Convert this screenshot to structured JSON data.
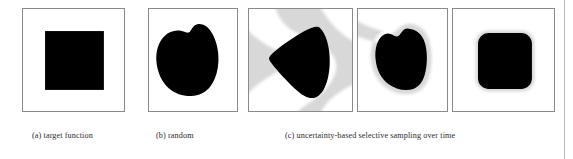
{
  "figure": {
    "kind": "figure-illustration",
    "background_color": "#ffffff",
    "panel_border_color": "#8a8a8a",
    "shape_fill_color": "#000000",
    "uncertainty_region_color": "#d8d8d8",
    "page_edge_rule_color": "#b9b9b9",
    "panels": [
      {
        "id": "panel-a",
        "group": "a",
        "shape": "square",
        "has_uncertainty_region": false,
        "x": 22,
        "y": 8,
        "w": 103,
        "h": 104
      },
      {
        "id": "panel-b",
        "group": "b",
        "shape": "irregular-blob",
        "has_uncertainty_region": false,
        "x": 148,
        "y": 8,
        "w": 90,
        "h": 104
      },
      {
        "id": "panel-c1",
        "group": "c",
        "shape": "triangle-blob",
        "has_uncertainty_region": true,
        "x": 248,
        "y": 8,
        "w": 105,
        "h": 104
      },
      {
        "id": "panel-c2",
        "group": "c",
        "shape": "rounded-blob",
        "has_uncertainty_region": true,
        "x": 357,
        "y": 8,
        "w": 91,
        "h": 104
      },
      {
        "id": "panel-c3",
        "group": "c",
        "shape": "rounded-square",
        "has_uncertainty_region": true,
        "x": 452,
        "y": 8,
        "w": 103,
        "h": 104
      }
    ],
    "captions": [
      {
        "id": "caption-a",
        "text": "(a) target function",
        "x": 32,
        "y": 130
      },
      {
        "id": "caption-b",
        "text": "(b) random",
        "x": 156,
        "y": 130
      },
      {
        "id": "caption-c",
        "text": "(c) uncertainty-based selective sampling over time",
        "x": 285,
        "y": 130
      }
    ]
  }
}
